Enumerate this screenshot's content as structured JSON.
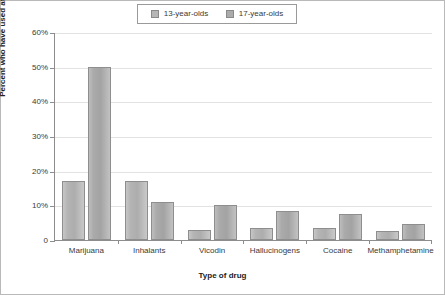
{
  "chart_data": {
    "type": "bar",
    "title": "",
    "xlabel": "Type of drug",
    "ylabel": "Percent who have used at least once",
    "categories": [
      "Marijuana",
      "Inhalants",
      "Vicodin",
      "Hallucinogens",
      "Cocaine",
      "Methamphetamine"
    ],
    "series": [
      {
        "name": "13-year-olds",
        "color": "#b6b6b6",
        "values": [
          17,
          17,
          3,
          3.5,
          3.5,
          2.5
        ]
      },
      {
        "name": "17-year-olds",
        "color": "#ababab",
        "values": [
          50,
          11,
          10,
          8.5,
          7.5,
          4.5
        ]
      }
    ],
    "ylim": [
      0,
      60
    ],
    "yticks": [
      0,
      10,
      20,
      30,
      40,
      50,
      60
    ],
    "ytick_labels": [
      "0",
      "10%",
      "20%",
      "30%",
      "40%",
      "50%",
      "60%"
    ],
    "grid": true,
    "legend_position": "top-center"
  },
  "legend": {
    "items": [
      {
        "label": "13-year-olds",
        "swatch_color": "#b6b6b6"
      },
      {
        "label": "17-year-olds",
        "swatch_color": "#ababab"
      }
    ]
  },
  "axes": {
    "x_title": "Type of drug",
    "y_title": "Percent who have used at least once"
  },
  "colors": {
    "axis": "#8d8d8d",
    "grid": "#e2e2e2",
    "text": "#3a3a3a",
    "border": "#b9b9b9"
  }
}
